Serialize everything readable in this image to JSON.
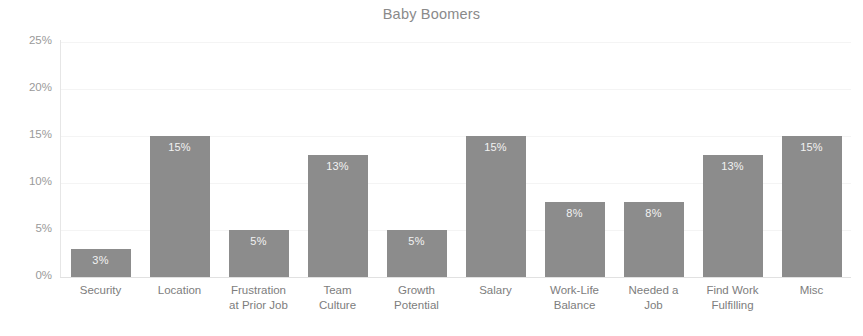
{
  "chart_data": {
    "type": "bar",
    "title": "Baby Boomers",
    "xlabel": "",
    "ylabel": "",
    "ylim": [
      0,
      25
    ],
    "grid": true,
    "legend": false,
    "legend_position": "none",
    "value_suffix": "%",
    "categories": [
      "Security",
      "Location",
      "Frustration\nat Prior Job",
      "Team\nCulture",
      "Growth\nPotential",
      "Salary",
      "Work-Life\nBalance",
      "Needed a\nJob",
      "Find Work\nFulfilling",
      "Misc"
    ],
    "values": [
      3,
      15,
      5,
      13,
      5,
      15,
      8,
      8,
      13,
      15
    ],
    "value_labels": [
      "3%",
      "15%",
      "5%",
      "13%",
      "5%",
      "15%",
      "8%",
      "8%",
      "13%",
      "15%"
    ],
    "ytick_values": [
      0,
      5,
      10,
      15,
      20,
      25
    ],
    "ytick_labels": [
      "0%",
      "5%",
      "10%",
      "15%",
      "20%",
      "25%"
    ],
    "colors": {
      "bar": "#8c8c8c",
      "bar_label": "#f2f2f2",
      "axis": "#e3e3e3",
      "tick_text": "#9a9a9a",
      "category_text": "#7d7d7d",
      "title_text": "#8a8a8a",
      "background": "#ffffff"
    }
  }
}
